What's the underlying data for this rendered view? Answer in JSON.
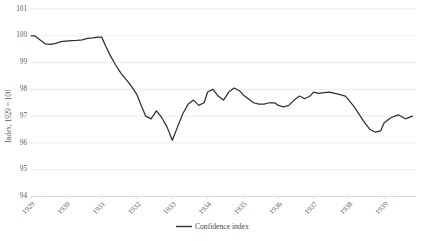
{
  "chart_data": {
    "type": "line",
    "title": "",
    "subtitle": "",
    "xlabel": "",
    "ylabel": "Index, 1929 = 100",
    "ylim": [
      94,
      101
    ],
    "yticks": [
      94,
      95,
      96,
      97,
      98,
      99,
      100,
      101
    ],
    "ytick_labels": [
      "94",
      "95",
      "96",
      "97",
      "98",
      "99",
      "100",
      "101"
    ],
    "xlim": [
      1929.0,
      1939.9
    ],
    "xticks": [
      1929,
      1930,
      1931,
      1932,
      1933,
      1934,
      1935,
      1936,
      1937,
      1938,
      1939
    ],
    "xtick_labels": [
      "1929",
      "1930",
      "1931",
      "1932",
      "1933",
      "1934",
      "1935",
      "1936",
      "1937",
      "1938",
      "1939"
    ],
    "grid": true,
    "grid_axis": "y",
    "legend_position": "bottom-center",
    "series": [
      {
        "name": "Confidence index",
        "color": "#2f2f2f",
        "x": [
          1929.0,
          1929.1,
          1929.25,
          1929.4,
          1929.55,
          1929.7,
          1929.85,
          1930.0,
          1930.15,
          1930.3,
          1930.45,
          1930.6,
          1930.75,
          1930.9,
          1931.0,
          1931.12,
          1931.25,
          1931.4,
          1931.55,
          1931.7,
          1931.85,
          1932.0,
          1932.12,
          1932.25,
          1932.4,
          1932.55,
          1932.7,
          1932.85,
          1933.0,
          1933.15,
          1933.3,
          1933.45,
          1933.6,
          1933.75,
          1933.9,
          1934.0,
          1934.15,
          1934.3,
          1934.45,
          1934.6,
          1934.75,
          1934.9,
          1935.0,
          1935.15,
          1935.3,
          1935.45,
          1935.6,
          1935.75,
          1935.9,
          1936.0,
          1936.15,
          1936.3,
          1936.45,
          1936.6,
          1936.75,
          1936.9,
          1937.0,
          1937.15,
          1937.3,
          1937.45,
          1937.6,
          1937.75,
          1937.9,
          1938.0,
          1938.15,
          1938.3,
          1938.45,
          1938.6,
          1938.75,
          1938.9,
          1939.0,
          1939.2,
          1939.4,
          1939.6,
          1939.8
        ],
        "y": [
          100.0,
          100.0,
          99.85,
          99.7,
          99.68,
          99.72,
          99.78,
          99.8,
          99.82,
          99.83,
          99.85,
          99.9,
          99.92,
          99.95,
          99.95,
          99.6,
          99.25,
          98.9,
          98.6,
          98.35,
          98.1,
          97.8,
          97.4,
          97.0,
          96.9,
          97.2,
          96.95,
          96.6,
          96.1,
          96.6,
          97.1,
          97.45,
          97.6,
          97.4,
          97.5,
          97.9,
          98.0,
          97.75,
          97.6,
          97.9,
          98.05,
          97.95,
          97.8,
          97.65,
          97.5,
          97.45,
          97.45,
          97.5,
          97.5,
          97.4,
          97.35,
          97.4,
          97.6,
          97.75,
          97.65,
          97.75,
          97.9,
          97.85,
          97.88,
          97.9,
          97.85,
          97.8,
          97.75,
          97.6,
          97.35,
          97.05,
          96.75,
          96.5,
          96.4,
          96.45,
          96.75,
          96.95,
          97.05,
          96.9,
          97.0
        ]
      }
    ]
  },
  "legend": {
    "items": [
      {
        "label": "Confidence index",
        "color": "#2f2f2f"
      }
    ]
  },
  "axis": {
    "y_title": "Index, 1929 = 100"
  }
}
